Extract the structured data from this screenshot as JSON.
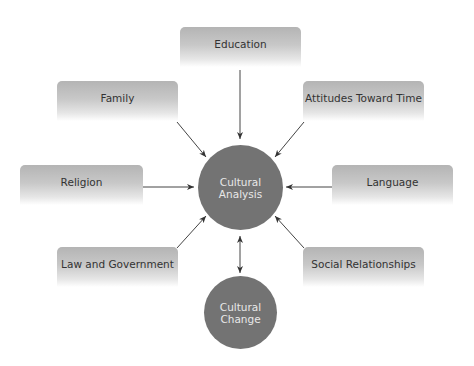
{
  "diagram": {
    "center": {
      "label_line1": "Cultural",
      "label_line2": "Analysis"
    },
    "outcome": {
      "label_line1": "Cultural",
      "label_line2": "Change"
    },
    "factors": [
      {
        "id": "education",
        "label": "Education"
      },
      {
        "id": "family",
        "label": "Family"
      },
      {
        "id": "attitudes-toward-time",
        "label": "Attitudes Toward Time"
      },
      {
        "id": "religion",
        "label": "Religion"
      },
      {
        "id": "language",
        "label": "Language"
      },
      {
        "id": "law-and-government",
        "label": "Law and Government"
      },
      {
        "id": "social-relationships",
        "label": "Social Relationships"
      }
    ],
    "edges": [
      {
        "from": "Education",
        "to": "Cultural Analysis"
      },
      {
        "from": "Family",
        "to": "Cultural Analysis"
      },
      {
        "from": "Attitudes Toward Time",
        "to": "Cultural Analysis"
      },
      {
        "from": "Religion",
        "to": "Cultural Analysis"
      },
      {
        "from": "Language",
        "to": "Cultural Analysis"
      },
      {
        "from": "Law and Government",
        "to": "Cultural Analysis"
      },
      {
        "from": "Social Relationships",
        "to": "Cultural Analysis"
      },
      {
        "from": "Cultural Analysis",
        "to": "Cultural Change",
        "bidirectional": true
      }
    ],
    "colors": {
      "circle": "#737373",
      "box_top": "#b4b4b4",
      "arrow": "#333333"
    }
  }
}
